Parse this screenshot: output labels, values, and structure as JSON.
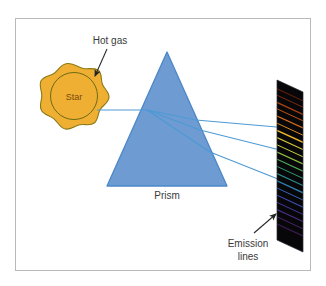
{
  "figure": {
    "background_color": "#ffffff",
    "border_color": "#b9b9b9"
  },
  "labels": {
    "hot_gas": "Hot gas",
    "star": "Star",
    "prism": "Prism",
    "emission_lines_line1": "Emission",
    "emission_lines_line2": "lines"
  },
  "colors": {
    "star_fill": "#eeaf33",
    "star_outline": "#8a7a17",
    "prism_fill": "#6d9bd2",
    "prism_outline": "#4b88c8",
    "ray": "#4e9ad4",
    "arrow": "#262626",
    "label_text": "#3a3a3a",
    "star_label_text": "#7a4a10",
    "screen_background": "#07070a"
  },
  "emission_lines": [
    {
      "color": "#5a1d0a",
      "offset": 0.055,
      "width": 1.2
    },
    {
      "color": "#7d2a0c",
      "offset": 0.095,
      "width": 1.0
    },
    {
      "color": "#a8410f",
      "offset": 0.14,
      "width": 1.4
    },
    {
      "color": "#c2560f",
      "offset": 0.18,
      "width": 1.0
    },
    {
      "color": "#d8691a",
      "offset": 0.225,
      "width": 1.3
    },
    {
      "color": "#e08a1e",
      "offset": 0.27,
      "width": 1.0
    },
    {
      "color": "#e8b22a",
      "offset": 0.315,
      "width": 1.5
    },
    {
      "color": "#dcc93a",
      "offset": 0.36,
      "width": 1.1
    },
    {
      "color": "#c6cf3e",
      "offset": 0.405,
      "width": 1.0
    },
    {
      "color": "#8fbf45",
      "offset": 0.45,
      "width": 1.3
    },
    {
      "color": "#4fae57",
      "offset": 0.495,
      "width": 1.2
    },
    {
      "color": "#2f9d72",
      "offset": 0.54,
      "width": 1.0
    },
    {
      "color": "#2b8f92",
      "offset": 0.585,
      "width": 1.1
    },
    {
      "color": "#2f7fae",
      "offset": 0.63,
      "width": 1.3
    },
    {
      "color": "#3566b4",
      "offset": 0.675,
      "width": 1.0
    },
    {
      "color": "#3a4aa8",
      "offset": 0.72,
      "width": 1.2
    },
    {
      "color": "#46399a",
      "offset": 0.765,
      "width": 1.0
    },
    {
      "color": "#4c2f86",
      "offset": 0.81,
      "width": 1.1
    },
    {
      "color": "#4a2568",
      "offset": 0.855,
      "width": 1.0
    },
    {
      "color": "#3a1b4c",
      "offset": 0.9,
      "width": 1.2
    }
  ],
  "rays": {
    "incoming_label": "starlight-beam",
    "outgoing_count": 3
  }
}
